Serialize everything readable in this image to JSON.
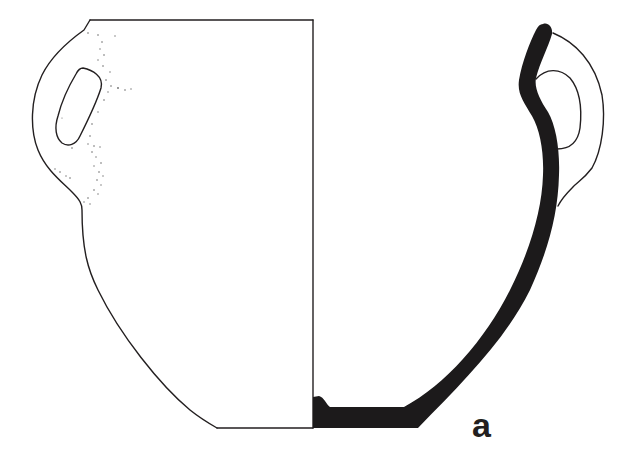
{
  "figure": {
    "type": "pottery-section-drawing",
    "label": "a",
    "colors": {
      "background": "#ffffff",
      "line": "#231f20",
      "section_fill": "#1c1a1b",
      "stipple": "#6b6b6b"
    },
    "parts": {
      "exterior_view": "left half, outline with stippled surface near handle",
      "section_profile": "right half, solid black wall section",
      "handles": 2
    }
  }
}
